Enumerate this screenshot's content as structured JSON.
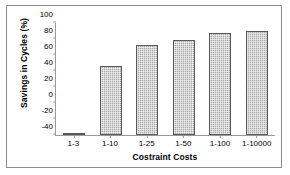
{
  "chart_data": {
    "type": "bar",
    "title": "",
    "categories": [
      "1-3",
      "1-10",
      "1-25",
      "1-50",
      "1-100",
      "1-10000"
    ],
    "values": [
      -38,
      46,
      73,
      79,
      87,
      90
    ],
    "xlabel": "Costraint Costs",
    "ylabel": "Savings in Cycles (%)",
    "ylim": [
      -40,
      100
    ],
    "ytick_step": 20,
    "yticks": [
      100,
      80,
      60,
      40,
      20,
      0,
      -20,
      -40
    ],
    "ytick_labels": [
      "100",
      "80",
      "60",
      "40",
      "20",
      "0",
      "-20",
      "-40"
    ],
    "grid": false,
    "legend": null,
    "bar_fill_color": "#a8a8a8",
    "bar_border_color": "#595959",
    "axis_color": "#9a9a9a",
    "frame_color": "#8c8c8c",
    "background_color": "#ffffff"
  }
}
